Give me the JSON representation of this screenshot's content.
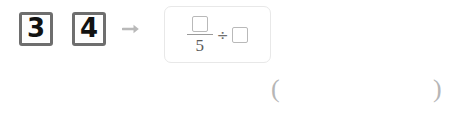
{
  "problem": {
    "tiles": [
      {
        "value": "3",
        "name": "digit-tile-3"
      },
      {
        "value": "4",
        "name": "digit-tile-4"
      }
    ],
    "arrow": "arrow-right-icon",
    "expression": {
      "fraction": {
        "numerator": "",
        "numerator_placeholder": "empty-box",
        "denominator": "5"
      },
      "operator": "÷",
      "operand": "",
      "operand_placeholder": "empty-box"
    }
  },
  "answer": {
    "open_paren": "(",
    "value": "",
    "close_paren": ")"
  },
  "colors": {
    "tile_border": "#6e6e6e",
    "tile_digit": "#111111",
    "arrow": "#b9b9b9",
    "card_border": "#e8e8e8",
    "box_border": "#b9b9b9",
    "fraction_bar": "#9a9a9a",
    "number_text": "#5a5a5a",
    "paren": "#b6b6b6"
  }
}
